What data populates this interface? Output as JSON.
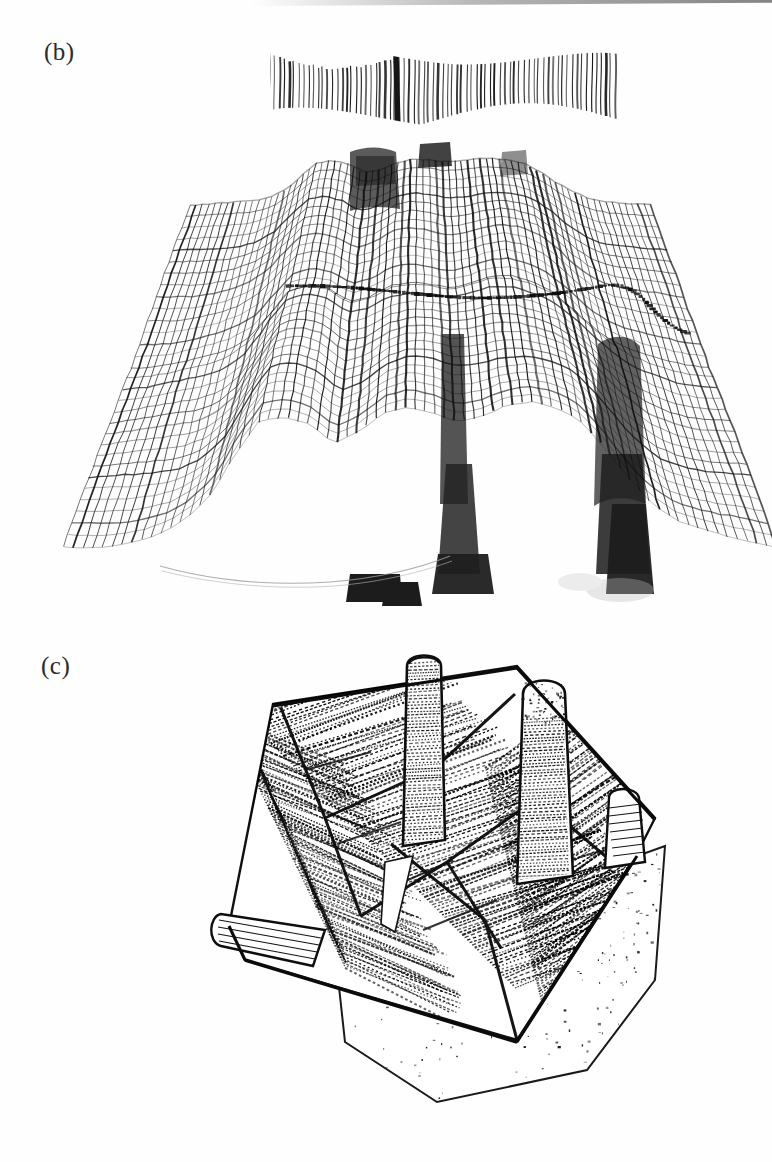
{
  "document": {
    "type": "scanned-figure-page",
    "background_color": "#fefefe",
    "ink_color": "#111111",
    "width": 772,
    "height": 1162
  },
  "panels": [
    {
      "id": "b",
      "label": "(b)",
      "label_position": {
        "x": 44,
        "y": 38
      },
      "description": "3D wireframe mesh surface plot rendered as hidden-line mesh, with an upper edge-on hatched band and a dotted contour curve crossing the surface",
      "bounds": {
        "x": 150,
        "y": 34,
        "width": 540,
        "height": 580
      }
    },
    {
      "id": "c",
      "label": "(c)",
      "label_position": {
        "x": 41,
        "y": 652
      },
      "description": "3D densely hatched tilted surface with rounded column-like protrusions rising from the plane and a speckled flat base plane below-right",
      "bounds": {
        "x": 185,
        "y": 648,
        "width": 500,
        "height": 480
      }
    }
  ],
  "chart_data": [
    {
      "id": "panel-b",
      "type": "line",
      "title": "(b)",
      "render_style": "3d-wireframe-mesh",
      "xlabel": "",
      "ylabel": "",
      "grid": false,
      "legend": null,
      "annotations": [
        {
          "kind": "dotted-contour",
          "y_px": 278,
          "x_start_px": 285,
          "x_end_px": 632
        }
      ],
      "features": {
        "edge_on_band": {
          "x_start_px": 275,
          "x_end_px": 616,
          "y_top_px": 48,
          "y_bottom_px": 112,
          "line_count": 74
        },
        "mesh_rows": 30,
        "mesh_cols": 74,
        "left_fan_edge_px": 185,
        "right_fan_edge_px": 668,
        "surface_top_px": 148,
        "surface_bottom_px": 600
      },
      "series": [
        {
          "name": "surface-profile-front",
          "x": [
            0,
            1,
            2,
            3,
            4,
            5,
            6,
            7,
            8,
            9,
            10,
            11,
            12,
            13,
            14,
            15,
            16,
            17,
            18,
            19,
            20,
            21,
            22,
            23,
            24,
            25,
            26,
            27,
            28,
            29
          ],
          "values": [
            0.04,
            0.05,
            0.07,
            0.1,
            0.14,
            0.22,
            0.38,
            0.66,
            0.9,
            0.93,
            0.88,
            0.74,
            0.8,
            0.92,
            0.97,
            0.95,
            0.9,
            0.93,
            0.99,
            1.0,
            0.96,
            0.88,
            0.72,
            0.52,
            0.34,
            0.22,
            0.15,
            0.1,
            0.07,
            0.05
          ]
        },
        {
          "name": "surface-profile-back",
          "x": [
            0,
            1,
            2,
            3,
            4,
            5,
            6,
            7,
            8,
            9,
            10,
            11,
            12,
            13,
            14,
            15,
            16,
            17,
            18,
            19,
            20,
            21,
            22,
            23,
            24,
            25,
            26,
            27,
            28,
            29
          ],
          "values": [
            0.02,
            0.03,
            0.05,
            0.08,
            0.12,
            0.19,
            0.33,
            0.58,
            0.82,
            0.86,
            0.8,
            0.66,
            0.72,
            0.85,
            0.9,
            0.88,
            0.83,
            0.86,
            0.92,
            0.94,
            0.9,
            0.82,
            0.66,
            0.46,
            0.29,
            0.18,
            0.12,
            0.08,
            0.05,
            0.03
          ]
        }
      ]
    },
    {
      "id": "panel-c",
      "type": "line",
      "title": "(c)",
      "render_style": "3d-hatched-surface",
      "xlabel": "",
      "ylabel": "",
      "grid": false,
      "legend": null,
      "annotations": [],
      "features": {
        "hatch_line_count": 120,
        "columns": [
          {
            "name": "column-1",
            "cx_px": 420,
            "top_px": 663,
            "height_px": 118,
            "width_px": 34
          },
          {
            "name": "column-2",
            "cx_px": 536,
            "top_px": 690,
            "height_px": 128,
            "width_px": 36
          },
          {
            "name": "column-3",
            "cx_px": 628,
            "top_px": 796,
            "height_px": 58,
            "width_px": 30
          },
          {
            "name": "column-4",
            "cx_px": 238,
            "top_px": 916,
            "height_px": 44,
            "width_px": 40
          }
        ],
        "base_plane": {
          "speckled": true,
          "x_px": 330,
          "y_px": 930,
          "width_px": 330,
          "height_px": 180
        },
        "plate_corners_px": [
          [
            270,
            700
          ],
          [
            660,
            800
          ],
          [
            500,
            1040
          ],
          [
            205,
            952
          ]
        ]
      },
      "series": [
        {
          "name": "hatched-plate-height",
          "x": [
            0,
            1,
            2,
            3,
            4,
            5,
            6,
            7,
            8,
            9,
            10,
            11,
            12,
            13,
            14,
            15,
            16,
            17,
            18,
            19
          ],
          "values": [
            0.1,
            0.12,
            0.15,
            0.18,
            0.22,
            0.26,
            0.3,
            0.35,
            0.4,
            0.46,
            0.52,
            0.58,
            0.62,
            0.66,
            0.7,
            0.74,
            0.78,
            0.82,
            0.86,
            0.9
          ]
        }
      ]
    }
  ]
}
